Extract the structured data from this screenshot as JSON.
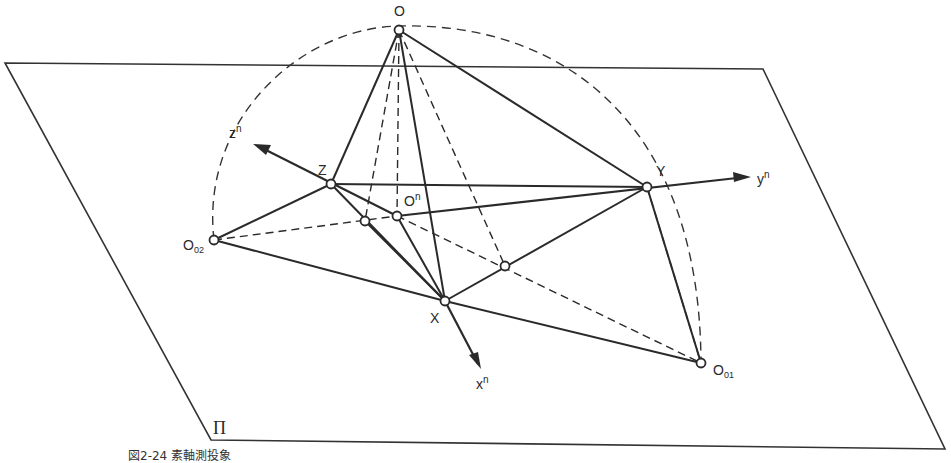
{
  "figure": {
    "caption": "図2-24 素軸測投象",
    "plane_label": "Π"
  },
  "points": {
    "O": {
      "label": "O",
      "x": 399,
      "y": 30
    },
    "Z": {
      "label": "Z",
      "x": 331,
      "y": 184
    },
    "Y": {
      "label": "Y",
      "x": 647,
      "y": 187
    },
    "X": {
      "label": "X",
      "x": 445,
      "y": 301
    },
    "On": {
      "label": "O",
      "sup": "n",
      "x": 397,
      "y": 216
    },
    "O02": {
      "label": "O",
      "sub": "02",
      "x": 214,
      "y": 240
    },
    "O01": {
      "label": "O",
      "sub": "01",
      "x": 701,
      "y": 363
    },
    "P1": {
      "x": 365,
      "y": 221
    },
    "P2": {
      "x": 505,
      "y": 266
    }
  },
  "axes": {
    "xn": {
      "label": "x",
      "sup": "n"
    },
    "yn": {
      "label": "y",
      "sup": "n"
    },
    "zn": {
      "label": "z",
      "sup": "n"
    }
  },
  "colors": {
    "line": "#2a2a2a",
    "background": "#ffffff"
  }
}
